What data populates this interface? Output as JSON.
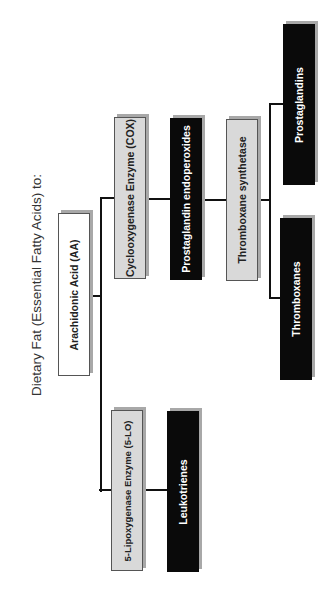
{
  "diagram": {
    "title": "Dietary Fat (Essential Fatty Acids) to:",
    "orientation": "rotated -90deg (reads bottom-to-top)",
    "colors": {
      "source_fill": "#ffffff",
      "enzyme_fill": "#d9d9d9",
      "product_fill": "#0a0a0a",
      "shadow": "#a8a8a8",
      "connector": "#111111"
    },
    "nodes": {
      "arachidonic_acid": {
        "label": "Arachidonic Acid (AA)",
        "type": "source"
      },
      "cox": {
        "label": "Cyclooxygenase Enzyme (COX)",
        "type": "enzyme"
      },
      "pg_endoperoxides": {
        "label": "Prostaglandin endoperoxides",
        "type": "product"
      },
      "tx_synthetase": {
        "label": "Thromboxane synthetase",
        "type": "enzyme"
      },
      "prostaglandins": {
        "label": "Prostaglandins",
        "type": "product"
      },
      "thromboxanes": {
        "label": "Thromboxanes",
        "type": "product"
      },
      "five_lo": {
        "label": "5-Lipoxygenase Enzyme (5-LO)",
        "type": "enzyme"
      },
      "leukotrienes": {
        "label": "Leukotrienes",
        "type": "product"
      }
    },
    "edges": [
      {
        "from": "Arachidonic Acid (AA)",
        "to": "Cyclooxygenase Enzyme (COX)"
      },
      {
        "from": "Arachidonic Acid (AA)",
        "to": "5-Lipoxygenase Enzyme (5-LO)"
      },
      {
        "from": "Cyclooxygenase Enzyme (COX)",
        "to": "Prostaglandin endoperoxides"
      },
      {
        "from": "Prostaglandin endoperoxides",
        "to": "Thromboxane synthetase"
      },
      {
        "from": "Thromboxane synthetase",
        "to": "Prostaglandins"
      },
      {
        "from": "Thromboxane synthetase",
        "to": "Thromboxanes"
      },
      {
        "from": "5-Lipoxygenase Enzyme (5-LO)",
        "to": "Leukotrienes"
      }
    ]
  }
}
